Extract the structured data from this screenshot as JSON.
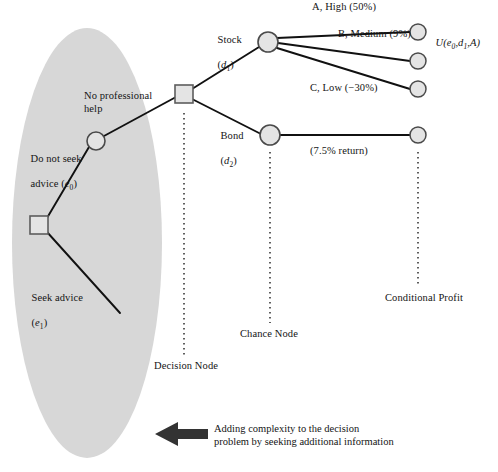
{
  "figure": {
    "type": "decision-tree",
    "title": "",
    "background": "#ffffff",
    "shade_color": "#d6d6d6",
    "node_fill": "#e2e2e2",
    "node_stroke": "#5a5a5a",
    "line_color": "#111111",
    "dotted_color": "#555555",
    "arrow_color": "#333333"
  },
  "branches": {
    "do_not_seek": "Do not seek\nadvice (e₀)",
    "do_not_seek_main": "Do not seek",
    "do_not_seek_sub": "advice (",
    "seek": "Seek advice\n(e₁)",
    "seek_main": "Seek advice",
    "no_professional_help": "No professional\nhelp",
    "stock": "Stock",
    "stock_sub": "d₁",
    "bond": "Bond",
    "bond_sub": "d₂"
  },
  "outcomes": [
    {
      "label": "A, High (50%)",
      "utility": "U(e₀,d₁,A)"
    },
    {
      "label": "B, Medium (9%)",
      "utility": ""
    },
    {
      "label": "C, Low (−30%)",
      "utility": ""
    },
    {
      "label": "(7.5% return)",
      "utility": ""
    }
  ],
  "stage_labels": {
    "decision_node": "Decision Node",
    "chance_node": "Chance Node",
    "conditional_profit": "Conditional Profit"
  },
  "footer": {
    "caption": "Adding complexity to the decision\nproblem by seeking additional information",
    "arrow_direction": "left"
  },
  "symbols": {
    "e0": "e",
    "e0_sub": "0",
    "e1": "e",
    "e1_sub": "1",
    "d1": "d",
    "d1_sub": "1",
    "d2": "d",
    "d2_sub": "2",
    "U": "U"
  }
}
